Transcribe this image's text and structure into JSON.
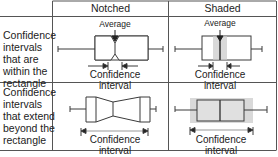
{
  "table": {
    "columns": [
      {
        "label": "Notched"
      },
      {
        "label": "Shaded"
      }
    ],
    "rows": [
      {
        "label_lines": [
          "Confidence",
          "intervals",
          "that are",
          "within the",
          "rectangle"
        ]
      },
      {
        "label_lines": [
          "Confidence",
          "intervals",
          "that extend",
          "beyond the",
          "rectangle"
        ]
      }
    ]
  },
  "annotations": {
    "average": "Average",
    "ci_line1": "Confidence",
    "ci_line2": "interval"
  },
  "colors": {
    "line": "#3a3a3a",
    "grid": "#555555",
    "shade": "#d9d9d9"
  }
}
